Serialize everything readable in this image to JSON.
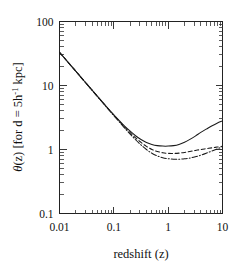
{
  "figure": {
    "background_color": "#ffffff",
    "foreground_color": "#1a1a1a"
  },
  "chart_data": {
    "type": "line",
    "title": "",
    "subtitle": "",
    "xlabel": "redshift  (z)",
    "ylabel": "θ(z)  [for d = 5h⁻¹ kpc]",
    "ylabel_parts": {
      "theta": "θ",
      "arg": "(z)",
      "bracket_open": "[for d = 5h",
      "exponent": "-1",
      "bracket_close": " kpc]"
    },
    "xscale": "log",
    "yscale": "log",
    "xlim": [
      0.01,
      10
    ],
    "ylim": [
      0.1,
      100
    ],
    "grid": false,
    "legend": "none",
    "xticks": [
      0.01,
      0.1,
      1,
      10
    ],
    "xtick_labels": [
      "0.01",
      "0.1",
      "1",
      "10"
    ],
    "yticks": [
      0.1,
      1,
      10,
      100
    ],
    "ytick_labels": [
      "0.1",
      "1",
      "10",
      "100"
    ],
    "minor_ticks": true,
    "series": [
      {
        "name": "solid",
        "linestyle": "solid",
        "color": "#1a1a1a",
        "x": [
          0.01,
          0.0126,
          0.0158,
          0.02,
          0.0251,
          0.0316,
          0.0398,
          0.0501,
          0.0631,
          0.0794,
          0.1,
          0.126,
          0.158,
          0.2,
          0.251,
          0.316,
          0.398,
          0.501,
          0.631,
          0.794,
          1.0,
          1.26,
          1.58,
          2.0,
          2.51,
          3.16,
          3.98,
          5.01,
          6.31,
          7.94,
          10.0
        ],
        "y": [
          33.0,
          26.3,
          21.0,
          16.7,
          13.3,
          10.6,
          8.45,
          6.75,
          5.4,
          4.33,
          3.49,
          2.83,
          2.32,
          1.93,
          1.64,
          1.43,
          1.29,
          1.2,
          1.15,
          1.13,
          1.13,
          1.15,
          1.2,
          1.3,
          1.44,
          1.62,
          1.85,
          2.08,
          2.33,
          2.58,
          2.8
        ]
      },
      {
        "name": "dashed",
        "linestyle": "dashed",
        "color": "#1a1a1a",
        "x": [
          0.01,
          0.0126,
          0.0158,
          0.02,
          0.0251,
          0.0316,
          0.0398,
          0.0501,
          0.0631,
          0.0794,
          0.1,
          0.126,
          0.158,
          0.2,
          0.251,
          0.316,
          0.398,
          0.501,
          0.631,
          0.794,
          1.0,
          1.26,
          1.58,
          2.0,
          2.51,
          3.16,
          3.98,
          5.01,
          6.31,
          7.94,
          10.0
        ],
        "y": [
          33.0,
          26.3,
          21.0,
          16.7,
          13.3,
          10.6,
          8.45,
          6.73,
          5.37,
          4.29,
          3.44,
          2.76,
          2.24,
          1.83,
          1.52,
          1.29,
          1.12,
          1.0,
          0.93,
          0.89,
          0.87,
          0.868,
          0.878,
          0.9,
          0.93,
          0.965,
          1.0,
          1.03,
          1.06,
          1.09,
          1.12
        ]
      },
      {
        "name": "dash-dot",
        "linestyle": "dashdot",
        "color": "#1a1a1a",
        "x": [
          0.01,
          0.0126,
          0.0158,
          0.02,
          0.0251,
          0.0316,
          0.0398,
          0.0501,
          0.0631,
          0.0794,
          0.1,
          0.126,
          0.158,
          0.2,
          0.251,
          0.316,
          0.398,
          0.501,
          0.631,
          0.794,
          1.0,
          1.26,
          1.58,
          2.0,
          2.51,
          3.16,
          3.98,
          5.01,
          6.31,
          7.94,
          10.0
        ],
        "y": [
          33.0,
          26.3,
          21.0,
          16.7,
          13.3,
          10.6,
          8.43,
          6.7,
          5.33,
          4.24,
          3.38,
          2.7,
          2.16,
          1.74,
          1.42,
          1.18,
          1.0,
          0.875,
          0.795,
          0.745,
          0.718,
          0.706,
          0.705,
          0.715,
          0.735,
          0.77,
          0.815,
          0.875,
          0.945,
          1.02,
          1.1
        ]
      }
    ],
    "annotations": []
  }
}
